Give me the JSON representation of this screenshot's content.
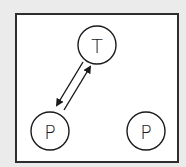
{
  "diagram": {
    "background_color": "#ebebeb",
    "frame": {
      "fill": "#ffffff",
      "border_color": "#2e2e2e"
    },
    "nodes": [
      {
        "id": "T",
        "label": "T",
        "cx": 97,
        "cy": 45,
        "r": 19
      },
      {
        "id": "P1",
        "label": "P",
        "cx": 50,
        "cy": 131,
        "r": 19
      },
      {
        "id": "P2",
        "label": "P",
        "cx": 146,
        "cy": 131,
        "r": 19
      }
    ],
    "edges": [
      {
        "from": "T",
        "to": "P1",
        "direction": "T-to-P"
      },
      {
        "from": "P1",
        "to": "T",
        "direction": "P-to-T"
      }
    ]
  }
}
